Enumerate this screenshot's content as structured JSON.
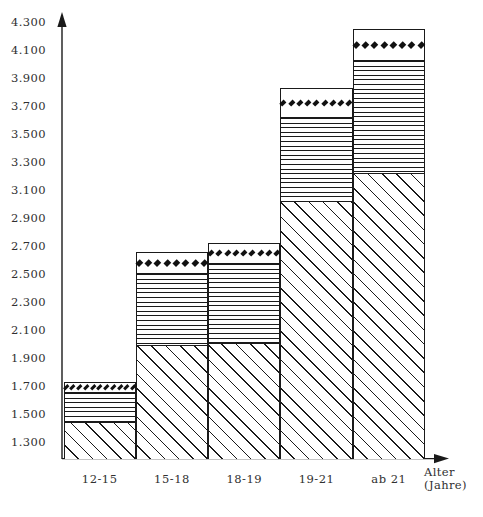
{
  "chart_data": {
    "type": "bar",
    "subtype": "stacked-bar",
    "title": "",
    "xlabel": "Alter (Jahre)",
    "ylabel": "",
    "categories": [
      "12-15",
      "15-18",
      "18-19",
      "19-21",
      "ab 21"
    ],
    "ylim": [
      1300,
      4300
    ],
    "ytick_labels": [
      "4.300",
      "4.100",
      "3.900",
      "3.700",
      "3.500",
      "3.300",
      "3.100",
      "2.900",
      "2.700",
      "2.500",
      "2.300",
      "2.100",
      "1.900",
      "1.700",
      "1.500",
      "1.300"
    ],
    "ytick_values": [
      4300,
      4100,
      3900,
      3700,
      3500,
      3300,
      3100,
      2900,
      2700,
      2500,
      2300,
      2100,
      1900,
      1700,
      1500,
      1300
    ],
    "ytick_step": 200,
    "grid": false,
    "legend": null,
    "series": [
      {
        "name": "diagonal-hatch-segment",
        "pattern": "diagonal-hatch",
        "cumulative_top": [
          1440,
          1990,
          2010,
          3020,
          3220
        ],
        "values": [
          140,
          690,
          710,
          1720,
          1920
        ]
      },
      {
        "name": "horizontal-line-segment",
        "pattern": "horizontal-lines",
        "cumulative_top": [
          1660,
          2510,
          2580,
          3620,
          4030
        ],
        "values": [
          220,
          520,
          570,
          600,
          810
        ]
      },
      {
        "name": "diamond-segment",
        "pattern": "diamonds",
        "cumulative_top": [
          1730,
          2660,
          2720,
          3830,
          4250
        ],
        "values": [
          70,
          150,
          140,
          210,
          220
        ]
      }
    ],
    "bar_totals": [
      1730,
      2660,
      2720,
      3830,
      4250
    ]
  },
  "axis": {
    "y_arrow": "up-arrow",
    "x_arrow": "right-arrow"
  }
}
